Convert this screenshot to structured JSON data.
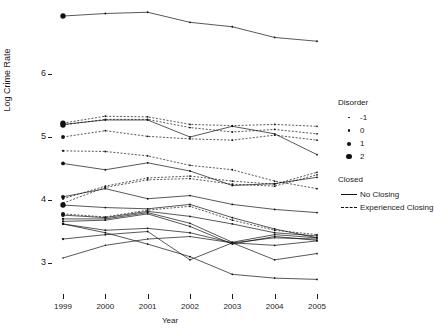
{
  "chart_data": {
    "type": "line",
    "title": "",
    "xlabel": "Year",
    "ylabel": "Log Crime Rate",
    "x": [
      1999,
      2000,
      2001,
      2002,
      2003,
      2004,
      2005
    ],
    "categories": [
      "1999",
      "2000",
      "2001",
      "2002",
      "2003",
      "2004",
      "2005"
    ],
    "xlim": [
      1999,
      2005
    ],
    "ylim": [
      2.6,
      7.1
    ],
    "yticks": [
      3,
      4,
      5,
      6
    ],
    "ytick_labels": [
      "3",
      "4",
      "5",
      "6"
    ],
    "grid": false,
    "legend_position": "right",
    "point_size_variable": "Disorder",
    "linetype_variable": "Closed",
    "series": [
      {
        "name": "unit-01",
        "closed": "No Closing",
        "disorder": 2,
        "values": [
          6.92,
          6.96,
          6.98,
          6.82,
          6.75,
          6.58,
          6.52
        ]
      },
      {
        "name": "unit-02",
        "closed": "Experienced Closing",
        "disorder": 2,
        "values": [
          5.22,
          5.33,
          5.32,
          5.2,
          5.18,
          5.2,
          5.17
        ]
      },
      {
        "name": "unit-03",
        "closed": "Experienced Closing",
        "disorder": 2,
        "values": [
          5.19,
          5.28,
          5.28,
          5.15,
          5.08,
          5.12,
          5.05
        ]
      },
      {
        "name": "unit-04",
        "closed": "No Closing",
        "disorder": 1,
        "values": [
          5.2,
          5.27,
          5.27,
          5.0,
          5.17,
          5.05,
          4.72
        ]
      },
      {
        "name": "unit-05",
        "closed": "Experienced Closing",
        "disorder": 1,
        "values": [
          5.0,
          5.1,
          5.01,
          4.97,
          4.95,
          5.03,
          4.95
        ]
      },
      {
        "name": "unit-06",
        "closed": "Experienced Closing",
        "disorder": 0,
        "values": [
          4.78,
          4.77,
          4.7,
          4.55,
          4.48,
          4.3,
          4.18
        ]
      },
      {
        "name": "unit-07",
        "closed": "No Closing",
        "disorder": 1,
        "values": [
          4.58,
          4.48,
          4.59,
          4.46,
          4.23,
          4.26,
          4.36
        ]
      },
      {
        "name": "unit-08",
        "closed": "Experienced Closing",
        "disorder": 0,
        "values": [
          4.02,
          4.22,
          4.35,
          4.38,
          4.3,
          4.25,
          4.44
        ]
      },
      {
        "name": "unit-09",
        "closed": "Experienced Closing",
        "disorder": 0,
        "values": [
          3.95,
          4.2,
          4.32,
          4.34,
          4.25,
          4.22,
          4.4
        ]
      },
      {
        "name": "unit-10",
        "closed": "No Closing",
        "disorder": 1,
        "values": [
          4.05,
          4.18,
          4.02,
          4.07,
          3.93,
          3.85,
          3.8
        ]
      },
      {
        "name": "unit-11",
        "closed": "No Closing",
        "disorder": 2,
        "values": [
          3.92,
          3.88,
          3.86,
          3.93,
          3.72,
          3.54,
          3.4
        ]
      },
      {
        "name": "unit-12",
        "closed": "Experienced Closing",
        "disorder": 1,
        "values": [
          3.78,
          3.73,
          3.84,
          3.9,
          3.68,
          3.52,
          3.45
        ]
      },
      {
        "name": "unit-13",
        "closed": "No Closing",
        "disorder": 1,
        "values": [
          3.76,
          3.72,
          3.82,
          3.74,
          3.62,
          3.48,
          3.43
        ]
      },
      {
        "name": "unit-14",
        "closed": "No Closing",
        "disorder": 0,
        "values": [
          3.7,
          3.7,
          3.8,
          3.63,
          3.33,
          3.45,
          3.4
        ]
      },
      {
        "name": "unit-15",
        "closed": "No Closing",
        "disorder": 0,
        "values": [
          3.66,
          3.68,
          3.78,
          3.58,
          3.3,
          3.42,
          3.36
        ]
      },
      {
        "name": "unit-16",
        "closed": "No Closing",
        "disorder": 0,
        "values": [
          3.62,
          3.52,
          3.55,
          3.48,
          3.32,
          3.28,
          3.35
        ]
      },
      {
        "name": "unit-17",
        "closed": "No Closing",
        "disorder": 0,
        "values": [
          3.38,
          3.45,
          3.5,
          3.05,
          3.32,
          3.05,
          3.15
        ]
      },
      {
        "name": "unit-18",
        "closed": "No Closing",
        "disorder": -1,
        "values": [
          3.08,
          3.28,
          3.38,
          3.42,
          3.32,
          3.4,
          3.38
        ]
      },
      {
        "name": "unit-19",
        "closed": "No Closing",
        "disorder": 0,
        "values": [
          3.62,
          3.48,
          3.3,
          3.1,
          2.82,
          2.76,
          2.74
        ]
      }
    ],
    "legend": {
      "disorder_title": "Disorder",
      "disorder_levels": [
        "-1",
        "0",
        "1",
        "2"
      ],
      "closed_title": "Closed",
      "closed_levels": [
        "No Closing",
        "Experienced Closing"
      ]
    }
  },
  "axes": {
    "y_label": "Log Crime Rate",
    "x_label": "Year",
    "y_ticks": [
      "3",
      "4",
      "5",
      "6"
    ],
    "x_ticks": [
      "1999",
      "2000",
      "2001",
      "2002",
      "2003",
      "2004",
      "2005"
    ]
  },
  "legend": {
    "disorder_title": "Disorder",
    "disorder_items": [
      {
        "label": "-1",
        "size": 1.6
      },
      {
        "label": "0",
        "size": 2.6
      },
      {
        "label": "1",
        "size": 4.0
      },
      {
        "label": "2",
        "size": 5.4
      }
    ],
    "closed_title": "Closed",
    "closed_items": [
      {
        "label": "No Closing",
        "style": "solid"
      },
      {
        "label": "Experienced Closing",
        "style": "dashed"
      }
    ]
  },
  "colors": {
    "ink": "#111111",
    "background": "#ffffff"
  }
}
